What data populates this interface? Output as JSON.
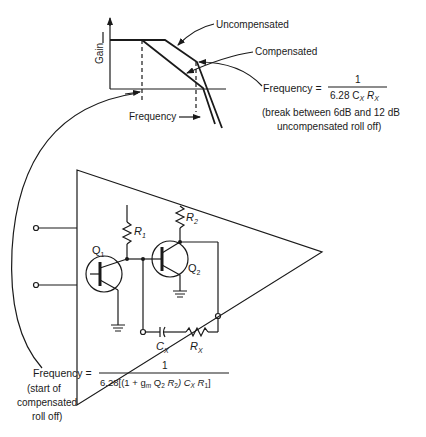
{
  "graph": {
    "y_axis_label": "Gain",
    "x_axis_label": "Frequency",
    "curves": [
      "Uncompensated",
      "Compensated"
    ],
    "break_formula": {
      "prefix": "Frequency =",
      "numerator": "1",
      "denominator": "6.28 C",
      "denominator_sub1": "X",
      "denominator_mid": " R",
      "denominator_sub2": "X",
      "note_line1": "(break between 6dB and 12 dB",
      "note_line2": "uncompensated roll off)"
    }
  },
  "circuit": {
    "transistors": [
      "Q1",
      "Q2"
    ],
    "resistors": [
      "R1",
      "R2",
      "RX"
    ],
    "capacitors": [
      "CX"
    ],
    "labels": {
      "q1": "Q",
      "q1_sub": "1",
      "q2": "Q",
      "q2_sub": "2",
      "r1": "R",
      "r1_sub": "1",
      "r2": "R",
      "r2_sub": "2",
      "cx": "C",
      "cx_sub": "X",
      "rx": "R",
      "rx_sub": "X"
    }
  },
  "start_formula": {
    "prefix": "Frequency =",
    "numerator": "1",
    "denominator": "6.28[(1 + g",
    "denominator_gm_sub": "m",
    "denominator_rest1": " Q",
    "denominator_q_sub": "2",
    "denominator_rest2": " R",
    "denominator_r2_sub": "2",
    "denominator_rest3": ") C",
    "denominator_cx_sub": "X",
    "denominator_rest4": " R",
    "denominator_r1_sub": "1",
    "denominator_end": "]",
    "note_line1": "(start of",
    "note_line2": "compensated",
    "note_line3": "roll off)"
  }
}
